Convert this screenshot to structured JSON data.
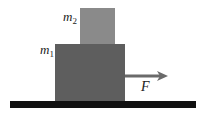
{
  "diagram": {
    "blocks": [
      {
        "id": "m2",
        "label_base": "m",
        "label_sub": "2",
        "color": "#8a8a8a"
      },
      {
        "id": "m1",
        "label_base": "m",
        "label_sub": "1",
        "color": "#5e5e5e"
      }
    ],
    "force": {
      "label": "F",
      "color": "#6a6a6a"
    },
    "ground": {
      "color": "#111111"
    }
  }
}
